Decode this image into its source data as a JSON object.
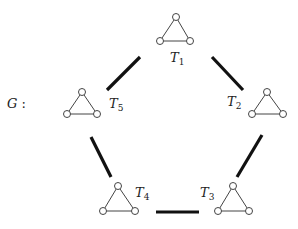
{
  "graph": {
    "name": "G",
    "name_suffix": " :",
    "nodes": [
      {
        "id": "T1",
        "label": "T",
        "subscript": "1"
      },
      {
        "id": "T2",
        "label": "T",
        "subscript": "2"
      },
      {
        "id": "T3",
        "label": "T",
        "subscript": "3"
      },
      {
        "id": "T4",
        "label": "T",
        "subscript": "4"
      },
      {
        "id": "T5",
        "label": "T",
        "subscript": "5"
      }
    ],
    "node_shape": "triangle (3 vertices, 3 edges)",
    "edges": [
      {
        "from": "T1",
        "to": "T2"
      },
      {
        "from": "T2",
        "to": "T3"
      },
      {
        "from": "T3",
        "to": "T4"
      },
      {
        "from": "T4",
        "to": "T5"
      },
      {
        "from": "T5",
        "to": "T1"
      }
    ],
    "colors": {
      "edge": "#111111",
      "triangle": "#444444",
      "background": "#ffffff"
    }
  }
}
